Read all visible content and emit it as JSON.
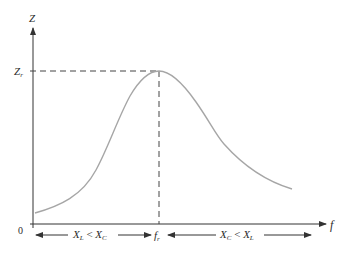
{
  "diagram": {
    "axes": {
      "y_label": "Z",
      "x_label": "f",
      "origin_label": "0"
    },
    "peak": {
      "y_label_main": "Z",
      "y_label_sub": "r",
      "x_label_main": "f",
      "x_label_sub": "r"
    },
    "regions": {
      "left": {
        "a_main": "X",
        "a_sub": "L",
        "op": " < ",
        "b_main": "X",
        "b_sub": "C"
      },
      "right": {
        "a_main": "X",
        "a_sub": "C",
        "op": " < ",
        "b_main": "X",
        "b_sub": "L"
      }
    },
    "colors": {
      "axis": "#333333",
      "curve": "#a6a6a6",
      "dashed": "#444444",
      "text": "#2b2b2b"
    }
  }
}
